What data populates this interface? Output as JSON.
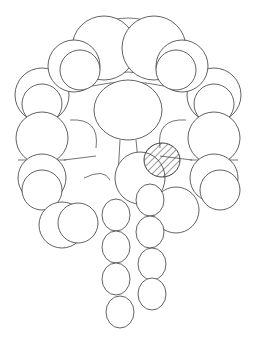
{
  "figure": {
    "type": "space-filling molecular model line drawing",
    "background": "#ffffff",
    "stroke_color": "#3a3a3a",
    "highlight_pattern": "diagonal-hatch",
    "highlight_color": "#2a2a2a"
  },
  "regions": {
    "top_arch": [
      {
        "cx": 104,
        "cy": 48,
        "r": 32
      },
      {
        "cx": 154,
        "cy": 48,
        "r": 32
      },
      {
        "cx": 74,
        "cy": 66,
        "r": 26
      },
      {
        "cx": 182,
        "cy": 66,
        "r": 26
      },
      {
        "cx": 80,
        "cy": 70,
        "r": 20
      },
      {
        "cx": 176,
        "cy": 70,
        "r": 20
      }
    ],
    "left_column": [
      {
        "cx": 42,
        "cy": 95,
        "r": 27
      },
      {
        "cx": 42,
        "cy": 104,
        "r": 20
      },
      {
        "cx": 42,
        "cy": 138,
        "r": 26
      },
      {
        "cx": 42,
        "cy": 178,
        "r": 24
      },
      {
        "cx": 42,
        "cy": 190,
        "r": 20
      },
      {
        "cx": 62,
        "cy": 225,
        "r": 23
      },
      {
        "cx": 78,
        "cy": 223,
        "r": 20
      }
    ],
    "right_column": [
      {
        "cx": 214,
        "cy": 95,
        "r": 27
      },
      {
        "cx": 214,
        "cy": 104,
        "r": 20
      },
      {
        "cx": 214,
        "cy": 138,
        "r": 26
      },
      {
        "cx": 214,
        "cy": 178,
        "r": 24
      },
      {
        "cx": 220,
        "cy": 190,
        "r": 20
      },
      {
        "cx": 176,
        "cy": 210,
        "r": 23
      }
    ],
    "center_ring": {
      "cx": 128,
      "cy": 110,
      "rx": 34,
      "ry": 30
    },
    "stem": [
      {
        "cx": 140,
        "cy": 178,
        "rx": 25,
        "ry": 26
      },
      {
        "cx": 150,
        "cy": 200,
        "rx": 14,
        "ry": 16
      },
      {
        "cx": 116,
        "cy": 215,
        "rx": 14,
        "ry": 16
      },
      {
        "cx": 150,
        "cy": 232,
        "rx": 14,
        "ry": 16
      },
      {
        "cx": 116,
        "cy": 247,
        "rx": 14,
        "ry": 16
      },
      {
        "cx": 152,
        "cy": 264,
        "rx": 14,
        "ry": 16
      },
      {
        "cx": 116,
        "cy": 279,
        "rx": 14,
        "ry": 16
      },
      {
        "cx": 152,
        "cy": 294,
        "rx": 14,
        "ry": 16
      },
      {
        "cx": 120,
        "cy": 312,
        "rx": 14,
        "ry": 16
      }
    ],
    "highlight": {
      "cx": 162,
      "cy": 160,
      "rx": 18,
      "ry": 17
    }
  }
}
